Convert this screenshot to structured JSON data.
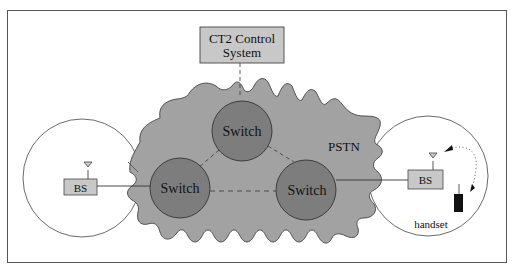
{
  "diagram": {
    "title_box": {
      "line1": "CT2 Control",
      "line2": "System"
    },
    "network_label": "PSTN",
    "switches": [
      {
        "id": "top",
        "label": "Switch"
      },
      {
        "id": "left",
        "label": "Switch"
      },
      {
        "id": "right",
        "label": "Switch"
      }
    ],
    "base_stations": [
      {
        "id": "left",
        "label": "BS"
      },
      {
        "id": "right",
        "label": "BS"
      }
    ],
    "handset_label": "handset",
    "colors": {
      "cloud_fill": "#a2a2a2",
      "switch_fill": "#7d7d7d",
      "box_fill": "#c8c8c8",
      "stroke": "#333333",
      "handset": "#111111"
    },
    "links": [
      {
        "from": "CT2 Control System",
        "to": "Switch (top)",
        "style": "dashed"
      },
      {
        "from": "Switch (top)",
        "to": "Switch (left)",
        "style": "dashed"
      },
      {
        "from": "Switch (top)",
        "to": "Switch (right)",
        "style": "dashed"
      },
      {
        "from": "Switch (left)",
        "to": "Switch (right)",
        "style": "dashed"
      },
      {
        "from": "BS (left)",
        "to": "Switch (left)",
        "style": "solid"
      },
      {
        "from": "Switch (right)",
        "to": "BS (right)",
        "style": "solid"
      },
      {
        "from": "BS (right)",
        "to": "handset",
        "style": "dotted-arrow"
      }
    ]
  }
}
